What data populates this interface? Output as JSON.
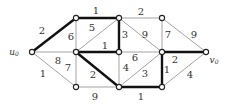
{
  "diagram": {
    "type": "weighted-graph",
    "nodes": [
      {
        "id": "u0",
        "x": 32,
        "y": 52,
        "label": "u",
        "sub": "0",
        "lx": 14,
        "ly": 52
      },
      {
        "id": "A",
        "x": 76,
        "y": 18
      },
      {
        "id": "B",
        "x": 119,
        "y": 18
      },
      {
        "id": "C",
        "x": 162,
        "y": 18
      },
      {
        "id": "D",
        "x": 76,
        "y": 52
      },
      {
        "id": "E",
        "x": 119,
        "y": 52
      },
      {
        "id": "F",
        "x": 162,
        "y": 52
      },
      {
        "id": "v0",
        "x": 206,
        "y": 52,
        "label": "v",
        "sub": "0",
        "lx": 214,
        "ly": 60
      },
      {
        "id": "G",
        "x": 76,
        "y": 87
      },
      {
        "id": "H",
        "x": 119,
        "y": 87
      },
      {
        "id": "I",
        "x": 162,
        "y": 87
      }
    ],
    "edges": [
      {
        "from": "u0",
        "to": "A",
        "w": "2",
        "bold": true,
        "lx": 42,
        "ly": 31
      },
      {
        "from": "u0",
        "to": "D",
        "w": "8",
        "bold": false,
        "lx": 58,
        "ly": 61
      },
      {
        "from": "u0",
        "to": "G",
        "w": "1",
        "bold": false,
        "lx": 43,
        "ly": 74
      },
      {
        "from": "A",
        "to": "D",
        "w": "6",
        "bold": false,
        "lx": 71,
        "ly": 37
      },
      {
        "from": "A",
        "to": "B",
        "w": "1",
        "bold": true,
        "lx": 96,
        "ly": 11
      },
      {
        "from": "D",
        "to": "B",
        "w": "5",
        "bold": false,
        "lx": 92,
        "ly": 28
      },
      {
        "from": "B",
        "to": "E",
        "w": "3",
        "bold": true,
        "lx": 125,
        "ly": 35
      },
      {
        "from": "B",
        "to": "C",
        "w": "2",
        "bold": false,
        "lx": 141,
        "ly": 12
      },
      {
        "from": "B",
        "to": "F",
        "w": "9",
        "bold": false,
        "lx": 145,
        "ly": 35
      },
      {
        "from": "C",
        "to": "F",
        "w": "7",
        "bold": false,
        "lx": 168,
        "ly": 35
      },
      {
        "from": "C",
        "to": "v0",
        "w": "9",
        "bold": false,
        "lx": 194,
        "ly": 35
      },
      {
        "from": "D",
        "to": "E",
        "w": "1",
        "bold": true,
        "lx": 105,
        "ly": 46
      },
      {
        "from": "D",
        "to": "G",
        "w": "7",
        "bold": false,
        "lx": 68,
        "ly": 68
      },
      {
        "from": "D",
        "to": "H",
        "w": "2",
        "bold": true,
        "lx": 93,
        "ly": 75
      },
      {
        "from": "E",
        "to": "H",
        "w": "4",
        "bold": false,
        "lx": 126,
        "ly": 68
      },
      {
        "from": "E",
        "to": "F",
        "w": "6",
        "bold": false,
        "lx": 135,
        "ly": 58
      },
      {
        "from": "H",
        "to": "F",
        "w": "3",
        "bold": false,
        "lx": 145,
        "ly": 74
      },
      {
        "from": "F",
        "to": "v0",
        "w": "2",
        "bold": true,
        "lx": 175,
        "ly": 60
      },
      {
        "from": "F",
        "to": "I",
        "w": "1",
        "bold": true,
        "lx": 167,
        "ly": 70
      },
      {
        "from": "I",
        "to": "v0",
        "w": "4",
        "bold": false,
        "lx": 190,
        "ly": 75
      },
      {
        "from": "G",
        "to": "H",
        "w": "9",
        "bold": false,
        "lx": 95,
        "ly": 97
      },
      {
        "from": "H",
        "to": "I",
        "w": "1",
        "bold": true,
        "lx": 141,
        "ly": 97
      }
    ]
  }
}
